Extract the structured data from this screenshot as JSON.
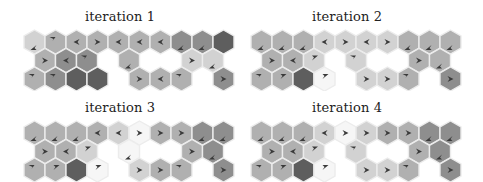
{
  "figure": {
    "shade_colors": {
      "1": "#f6f6f6",
      "2": "#d2d2d2",
      "3": "#b0b0b0",
      "4": "#8e8e8e",
      "5": "#5e5e5e"
    },
    "stroke_color": "#ececec",
    "arrow_color": "#3a3a3a",
    "layout": {
      "row1_cols": [
        0,
        1,
        2,
        3,
        4,
        5,
        6,
        7,
        8,
        9
      ],
      "row2_cols": [
        0,
        1,
        2,
        4,
        7,
        8
      ],
      "row3_cols": [
        0,
        1,
        2,
        3,
        5,
        6,
        7,
        9
      ]
    },
    "panels": [
      {
        "title": "iteration 1",
        "rows": [
          [
            [
              2,
              "dl"
            ],
            [
              3,
              "ul"
            ],
            [
              3,
              "l"
            ],
            [
              3,
              "r"
            ],
            [
              3,
              "l"
            ],
            [
              3,
              "l"
            ],
            [
              3,
              "l"
            ],
            [
              4,
              "dl"
            ],
            [
              4,
              "dl"
            ],
            [
              5,
              ""
            ]
          ],
          [
            [
              3,
              "r"
            ],
            [
              4,
              "l"
            ],
            [
              4,
              "ul"
            ],
            [
              3,
              "dl"
            ],
            [
              2,
              "r"
            ],
            [
              2,
              "dl"
            ]
          ],
          [
            [
              3,
              "ul"
            ],
            [
              4,
              "ul"
            ],
            [
              5,
              ""
            ],
            [
              5,
              ""
            ],
            [
              3,
              "r"
            ],
            [
              3,
              "l"
            ],
            [
              3,
              "ul"
            ],
            [
              4,
              "r"
            ]
          ]
        ]
      },
      {
        "title": "iteration 2",
        "rows": [
          [
            [
              3,
              "dl"
            ],
            [
              3,
              "dl"
            ],
            [
              3,
              "dl"
            ],
            [
              2,
              "l"
            ],
            [
              2,
              "r"
            ],
            [
              2,
              "l"
            ],
            [
              2,
              "r"
            ],
            [
              3,
              "dl"
            ],
            [
              3,
              "dl"
            ],
            [
              3,
              "dl"
            ]
          ],
          [
            [
              3,
              "r"
            ],
            [
              3,
              "l"
            ],
            [
              2,
              "ur"
            ],
            [
              2,
              "ul"
            ],
            [
              3,
              "r"
            ],
            [
              3,
              "dl"
            ]
          ],
          [
            [
              3,
              "ul"
            ],
            [
              3,
              "ur"
            ],
            [
              5,
              ""
            ],
            [
              1,
              "ur"
            ],
            [
              2,
              "r"
            ],
            [
              2,
              "r"
            ],
            [
              3,
              "ul"
            ],
            [
              4,
              "r"
            ]
          ]
        ]
      },
      {
        "title": "iteration 3",
        "rows": [
          [
            [
              3,
              "dl"
            ],
            [
              3,
              "dl"
            ],
            [
              3,
              "dl"
            ],
            [
              3,
              "l"
            ],
            [
              2,
              "l"
            ],
            [
              1,
              "r"
            ],
            [
              3,
              "r"
            ],
            [
              3,
              "r"
            ],
            [
              4,
              "dl"
            ],
            [
              4,
              "dl"
            ]
          ],
          [
            [
              3,
              "r"
            ],
            [
              3,
              "l"
            ],
            [
              2,
              "ur"
            ],
            [
              1,
              "dl"
            ],
            [
              3,
              "r"
            ],
            [
              4,
              "dl"
            ]
          ],
          [
            [
              3,
              "ul"
            ],
            [
              3,
              "ur"
            ],
            [
              5,
              ""
            ],
            [
              1,
              "ur"
            ],
            [
              2,
              "r"
            ],
            [
              3,
              "r"
            ],
            [
              3,
              "ul"
            ],
            [
              4,
              "r"
            ]
          ]
        ]
      },
      {
        "title": "iteration 4",
        "rows": [
          [
            [
              3,
              "dl"
            ],
            [
              3,
              "dl"
            ],
            [
              3,
              "dl"
            ],
            [
              2,
              "l"
            ],
            [
              1,
              "r"
            ],
            [
              2,
              "r"
            ],
            [
              3,
              "r"
            ],
            [
              3,
              "r"
            ],
            [
              4,
              "dl"
            ],
            [
              4,
              "dl"
            ]
          ],
          [
            [
              3,
              "r"
            ],
            [
              3,
              "l"
            ],
            [
              2,
              "ur"
            ],
            [
              2,
              "ul"
            ],
            [
              3,
              "r"
            ],
            [
              4,
              "dl"
            ]
          ],
          [
            [
              3,
              "ul"
            ],
            [
              3,
              "ur"
            ],
            [
              5,
              ""
            ],
            [
              1,
              "ur"
            ],
            [
              2,
              "r"
            ],
            [
              2,
              "r"
            ],
            [
              3,
              "ul"
            ],
            [
              4,
              "r"
            ]
          ]
        ]
      }
    ]
  }
}
